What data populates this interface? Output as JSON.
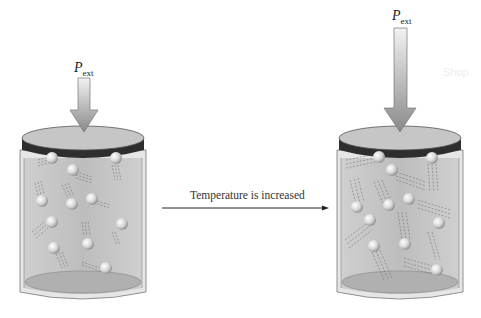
{
  "figure": {
    "left_container": {
      "pressure_label": "P",
      "pressure_subscript": "ext",
      "state": "before",
      "molecule_count": 11
    },
    "right_container": {
      "pressure_label": "P",
      "pressure_subscript": "ext",
      "state": "after",
      "molecule_count": 11
    },
    "transition": {
      "label": "Temperature is increased",
      "direction": "left-to-right"
    },
    "watermark": "Shop",
    "colors": {
      "gas_fill": "#b9b9b9",
      "piston_top": "#c4c4c4",
      "piston_band": "#2e2e2e",
      "arrow_fill": "#9a9a9a",
      "cylinder_wall": "#e4e4e4",
      "molecule": "#e8e8e8"
    }
  }
}
